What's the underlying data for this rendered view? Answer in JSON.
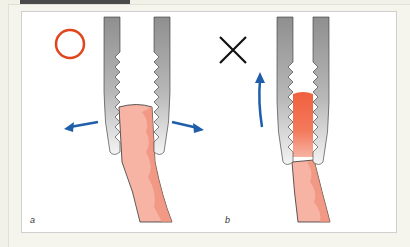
{
  "figure": {
    "panels": [
      {
        "label": "a",
        "mark": "circle-correct",
        "mark_color": "#e0451e",
        "arrows": "outward-horizontal"
      },
      {
        "label": "b",
        "mark": "cross-incorrect",
        "mark_color": "#111111",
        "arrows": "upward"
      }
    ],
    "colors": {
      "arrow": "#1f5ea8",
      "tissue": "#f7b3a3",
      "tissue_dark": "#f08f78",
      "tissue_compressed": "#f0603e",
      "instrument": "#9a9a9a"
    }
  }
}
